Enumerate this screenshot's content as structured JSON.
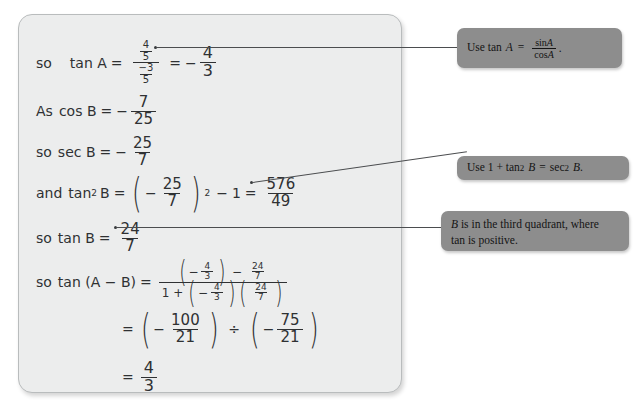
{
  "panel": {
    "lines": [
      {
        "id": "line-tan-a",
        "label": "so",
        "lhs": "tan A",
        "eq1": "=",
        "num": "4",
        "numden": "5",
        "den": "−3",
        "denden": "5",
        "eq2": "=",
        "result_sign": "−",
        "result_num": "4",
        "result_den": "3"
      },
      {
        "id": "line-cos-b",
        "label": "As",
        "lhs": "cos B",
        "eq": "=",
        "sign": "−",
        "num": "7",
        "den": "25"
      },
      {
        "id": "line-sec-b",
        "label": "so",
        "lhs": "sec B",
        "eq": "=",
        "sign": "−",
        "num": "25",
        "den": "7"
      },
      {
        "id": "line-tan2-b",
        "label": "and",
        "lhs": "tan",
        "lhs_sup": "2",
        "lhs_var": "B",
        "eq": "=",
        "p_sign": "−",
        "p_num": "25",
        "p_den": "7",
        "power": "2",
        "minus": "−",
        "one": "1",
        "eq2": "=",
        "r_num": "576",
        "r_den": "49"
      },
      {
        "id": "line-tan-b",
        "label": "so",
        "lhs": "tan B",
        "eq": "=",
        "num": "24",
        "den": "7"
      },
      {
        "id": "line-tan-a-minus-b",
        "label": "so",
        "lhs": "tan (A − B)",
        "eq": "=",
        "num_a_sign": "−",
        "num_a_num": "4",
        "num_a_den": "3",
        "num_minus": "−",
        "num_b_num": "24",
        "num_b_den": "7",
        "den_one": "1 +",
        "den_a_sign": "−",
        "den_a_num": "4",
        "den_a_den": "3",
        "den_b_num": "24",
        "den_b_den": "7"
      },
      {
        "id": "line-divide",
        "eq": "=",
        "left_sign": "−",
        "left_num": "100",
        "left_den": "21",
        "divide": "÷",
        "right_sign": "−",
        "right_num": "75",
        "right_den": "21"
      },
      {
        "id": "line-final",
        "eq": "=",
        "num": "4",
        "den": "3"
      }
    ]
  },
  "callouts": [
    {
      "id": "callout-tan-identity",
      "lead": "Use tan",
      "var": "A",
      "eq": "=",
      "num": "sin",
      "num_var": "A",
      "den": "cos",
      "den_var": "A",
      "period": "."
    },
    {
      "id": "callout-pythagorean-identity",
      "text_a": "Use 1 + tan",
      "sup_a": "2",
      "var_a": "B",
      "eq": "=",
      "text_b": "sec",
      "sup_b": "2",
      "var_b": "B",
      "period": "."
    },
    {
      "id": "callout-quadrant",
      "var": "B",
      "line1": "is in the third quadrant, where",
      "line2": "tan is positive."
    }
  ],
  "colors": {
    "panel_bg": "#eceded",
    "panel_border": "#b9bcbd",
    "callout_bg": "#8d8d8d",
    "ink": "#2f3133",
    "leader": "#4b4d4f"
  }
}
